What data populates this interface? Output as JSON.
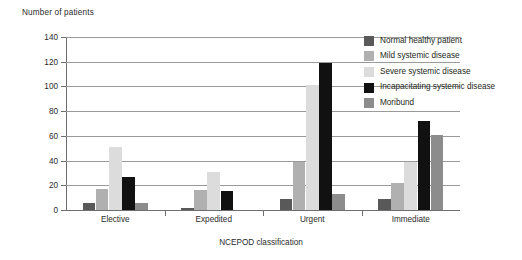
{
  "chart_data": {
    "type": "bar",
    "title": "",
    "ylabel": "Number of patients",
    "xlabel": "NCEPOD classification",
    "ylim": [
      0,
      140
    ],
    "yticks": [
      0,
      20,
      40,
      60,
      80,
      100,
      120,
      140
    ],
    "grid": true,
    "legend_position": "top-right",
    "categories": [
      "Elective",
      "Expedited",
      "Urgent",
      "Immediate"
    ],
    "series": [
      {
        "name": "Normal healthy patient",
        "color": "#595959",
        "values": [
          6,
          2,
          9,
          9
        ]
      },
      {
        "name": "Mild systemic disease",
        "color": "#b0b0b0",
        "values": [
          17,
          16,
          39,
          22
        ]
      },
      {
        "name": "Severe systemic disease",
        "color": "#dcdcdc",
        "values": [
          51,
          31,
          101,
          39
        ]
      },
      {
        "name": "Incapacitating systemic disease",
        "color": "#111111",
        "values": [
          27,
          15,
          119,
          72
        ]
      },
      {
        "name": "Moribund",
        "color": "#8c8c8c",
        "values": [
          6,
          0,
          13,
          61
        ]
      }
    ]
  }
}
